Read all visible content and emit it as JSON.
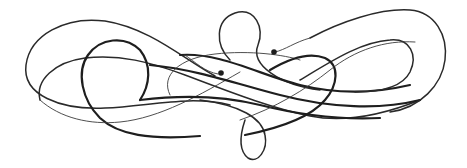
{
  "image": {
    "subject": "calligraphic flourish ornament",
    "background_color": "#ffffff",
    "ink_color": "#1e1e1e"
  }
}
